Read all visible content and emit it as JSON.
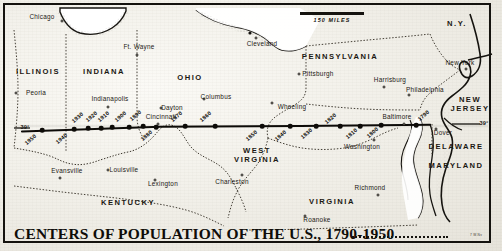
{
  "map": {
    "title": "CENTERS OF POPULATION OF THE U.S., 1790-1950",
    "credit": "7 W.Nv",
    "scale_label": "150 MILES",
    "latitude_left": "39°",
    "latitude_right": "39°",
    "colors": {
      "paper": "#f0eee7",
      "ink": "#15130f",
      "border_dotted": "#3b362c",
      "water": "#ffffff"
    }
  },
  "states": [
    {
      "name": "ILLINOIS",
      "x": 38,
      "y": 72,
      "lines": [
        "ILLINOIS"
      ]
    },
    {
      "name": "INDIANA",
      "x": 104,
      "y": 72,
      "lines": [
        "INDIANA"
      ]
    },
    {
      "name": "OHIO",
      "x": 190,
      "y": 78,
      "lines": [
        "OHIO"
      ]
    },
    {
      "name": "PENNSYLVANIA",
      "x": 340,
      "y": 57,
      "lines": [
        "PENNSYLVANIA"
      ]
    },
    {
      "name": "N.Y.",
      "x": 457,
      "y": 24,
      "lines": [
        "N.Y."
      ]
    },
    {
      "name": "NEW JERSEY",
      "x": 470,
      "y": 104,
      "lines": [
        "NEW",
        "JERSEY"
      ]
    },
    {
      "name": "DELAWARE",
      "x": 456,
      "y": 147,
      "lines": [
        "DELAWARE"
      ]
    },
    {
      "name": "MARYLAND",
      "x": 456,
      "y": 166,
      "lines": [
        "MARYLAND"
      ]
    },
    {
      "name": "WEST VIRGINIA",
      "x": 257,
      "y": 155,
      "lines": [
        "WEST",
        "VIRGINIA"
      ]
    },
    {
      "name": "VIRGINIA",
      "x": 332,
      "y": 202,
      "lines": [
        "VIRGINIA"
      ]
    },
    {
      "name": "KENTUCKY",
      "x": 128,
      "y": 203,
      "lines": [
        "KENTUCKY"
      ]
    }
  ],
  "cities": [
    {
      "name": "Chicago",
      "lx": 42,
      "ly": 17,
      "dx": 62,
      "dy": 21
    },
    {
      "name": "Ft. Wayne",
      "lx": 139,
      "ly": 47,
      "dx": 137,
      "dy": 55
    },
    {
      "name": "Cleveland",
      "lx": 262,
      "ly": 44,
      "dx": 256,
      "dy": 38
    },
    {
      "name": "Peoria",
      "lx": 36,
      "ly": 93,
      "dx": 16,
      "dy": 93
    },
    {
      "name": "Indianapolis",
      "lx": 110,
      "ly": 99,
      "dx": 108,
      "dy": 107
    },
    {
      "name": "Dayton",
      "lx": 172,
      "ly": 108,
      "dx": 161,
      "dy": 108
    },
    {
      "name": "Columbus",
      "lx": 216,
      "ly": 97,
      "dx": 204,
      "dy": 99
    },
    {
      "name": "Cincinnati",
      "lx": 161,
      "ly": 117,
      "dx": 158,
      "dy": 124
    },
    {
      "name": "Wheeling",
      "lx": 292,
      "ly": 107,
      "dx": 272,
      "dy": 103
    },
    {
      "name": "Pittsburgh",
      "lx": 318,
      "ly": 74,
      "dx": 299,
      "dy": 74
    },
    {
      "name": "Harrisburg",
      "lx": 390,
      "ly": 80,
      "dx": 384,
      "dy": 87
    },
    {
      "name": "Philadelphia",
      "lx": 425,
      "ly": 90,
      "dx": 409,
      "dy": 95
    },
    {
      "name": "New York",
      "lx": 460,
      "ly": 63,
      "dx": 466,
      "dy": 69
    },
    {
      "name": "Baltimore",
      "lx": 397,
      "ly": 117,
      "dx": 404,
      "dy": 124
    },
    {
      "name": "Washington",
      "lx": 362,
      "ly": 147,
      "dx": 374,
      "dy": 140
    },
    {
      "name": "Dover",
      "lx": 443,
      "ly": 133,
      "dx": 436,
      "dy": 129
    },
    {
      "name": "Richmond",
      "lx": 370,
      "ly": 188,
      "dx": 378,
      "dy": 195
    },
    {
      "name": "Roanoke",
      "lx": 317,
      "ly": 220,
      "dx": 305,
      "dy": 216
    },
    {
      "name": "Charleston",
      "lx": 232,
      "ly": 182,
      "dx": 242,
      "dy": 175
    },
    {
      "name": "Lexington",
      "lx": 163,
      "ly": 184,
      "dx": 155,
      "dy": 180
    },
    {
      "name": "Louisville",
      "lx": 124,
      "ly": 170,
      "dx": 108,
      "dy": 170
    },
    {
      "name": "Evansville",
      "lx": 67,
      "ly": 171,
      "dx": 60,
      "dy": 178
    }
  ],
  "population_centers": [
    {
      "year": "1950",
      "x": 42,
      "y": 130,
      "lx": 31,
      "ly": 140
    },
    {
      "year": "1940",
      "x": 74,
      "y": 129,
      "lx": 62,
      "ly": 139
    },
    {
      "year": "1930",
      "x": 88,
      "y": 128,
      "lx": 78,
      "ly": 118
    },
    {
      "year": "1920",
      "x": 101,
      "y": 128,
      "lx": 92,
      "ly": 117
    },
    {
      "year": "1910",
      "x": 112,
      "y": 127,
      "lx": 104,
      "ly": 117
    },
    {
      "year": "1900",
      "x": 129,
      "y": 127,
      "lx": 121,
      "ly": 117
    },
    {
      "year": "1890",
      "x": 143,
      "y": 126,
      "lx": 136,
      "ly": 116
    },
    {
      "year": "1880",
      "x": 156,
      "y": 127,
      "lx": 147,
      "ly": 136
    },
    {
      "year": "1870",
      "x": 185,
      "y": 126,
      "lx": 177,
      "ly": 117
    },
    {
      "year": "1860",
      "x": 215,
      "y": 126,
      "lx": 206,
      "ly": 117
    },
    {
      "year": "1850",
      "x": 262,
      "y": 126,
      "lx": 252,
      "ly": 136
    },
    {
      "year": "1840",
      "x": 290,
      "y": 126,
      "lx": 281,
      "ly": 136
    },
    {
      "year": "1830",
      "x": 316,
      "y": 126,
      "lx": 307,
      "ly": 134
    },
    {
      "year": "1820",
      "x": 340,
      "y": 126,
      "lx": 331,
      "ly": 119
    },
    {
      "year": "1810",
      "x": 360,
      "y": 126,
      "lx": 352,
      "ly": 134
    },
    {
      "year": "1800",
      "x": 381,
      "y": 125,
      "lx": 373,
      "ly": 133
    },
    {
      "year": "1790",
      "x": 416,
      "y": 125,
      "lx": 424,
      "ly": 116
    }
  ]
}
